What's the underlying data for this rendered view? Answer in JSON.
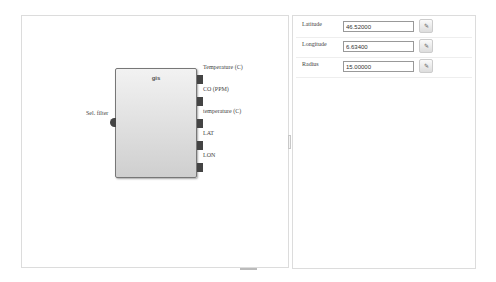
{
  "canvas": {
    "block": {
      "title": "gis",
      "input": {
        "label": "Sel. filter"
      },
      "outputs": [
        {
          "label": "Temperature (C)"
        },
        {
          "label": "CO (PPM)"
        },
        {
          "label": "temperature (C)"
        },
        {
          "label": "LAT"
        },
        {
          "label": "LON"
        }
      ]
    }
  },
  "properties": {
    "rows": [
      {
        "label": "Latitude",
        "value": "46.52000",
        "button_icon": "✎"
      },
      {
        "label": "Longitude",
        "value": "6.63400",
        "button_icon": "✎"
      },
      {
        "label": "Radius",
        "value": "15.00000",
        "button_icon": "✎"
      }
    ]
  }
}
